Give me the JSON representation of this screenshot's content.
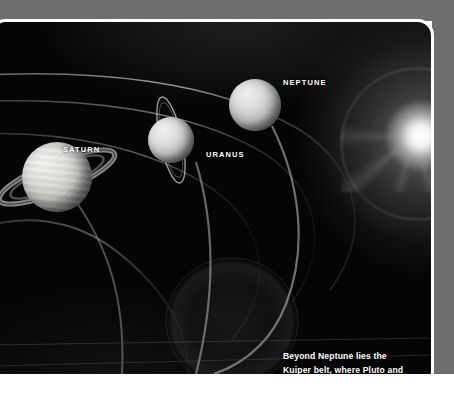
{
  "page": {
    "background_color": "#050505",
    "backdrop_color": "#6e6e6e",
    "border_color": "#fdfdfd",
    "label_color": "#ffffff"
  },
  "planets": [
    {
      "name": "SATURN",
      "label": "SATURN",
      "has_rings": true,
      "ring_tilt_deg": -22
    },
    {
      "name": "URANUS",
      "label": "URANUS",
      "has_rings": true,
      "ring_tilt_deg": 80
    },
    {
      "name": "NEPTUNE",
      "label": "NEPTUNE",
      "has_rings": false,
      "ring_tilt_deg": 0
    }
  ],
  "caption": {
    "line1": "Beyond Neptune lies the",
    "line2": "Kuiper belt, where Pluto and",
    "line3": "other dwarf planets orbit.",
    "text": "Beyond Neptune lies the Kuiper belt, where Pluto and other dwarf planets orbit."
  },
  "features": {
    "sun_glow": "sun-glow-right-edge",
    "kuiper_belt": "faint-disc-lower-center",
    "orbit_count": 5
  }
}
